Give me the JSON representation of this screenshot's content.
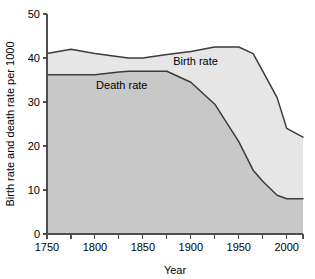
{
  "chart_data": {
    "type": "area",
    "title": "",
    "xlabel": "Year",
    "ylabel": "Birth rate and death rate per 1000",
    "xlim": [
      1750,
      2017
    ],
    "ylim": [
      0,
      50
    ],
    "grid": false,
    "legend_position": "inline-annotation",
    "x_ticks": [
      "1750",
      "1800",
      "1850",
      "1900",
      "1950",
      "2000"
    ],
    "x_tick_values": [
      1750,
      1800,
      1850,
      1900,
      1950,
      2000
    ],
    "x_minor_tick_values": [
      1775,
      1825,
      1875,
      1925,
      1975
    ],
    "y_ticks": [
      "0",
      "10",
      "20",
      "30",
      "40",
      "50"
    ],
    "y_tick_values": [
      0,
      10,
      20,
      30,
      40,
      50
    ],
    "x": [
      1750,
      1775,
      1800,
      1825,
      1835,
      1850,
      1875,
      1900,
      1925,
      1950,
      1965,
      1975,
      1990,
      2000,
      2017
    ],
    "series": [
      {
        "name": "Birth rate",
        "label": "Birth rate",
        "values": [
          41.0,
          42.0,
          41.0,
          40.3,
          40.0,
          40.0,
          40.8,
          41.5,
          42.5,
          42.5,
          41.0,
          37.0,
          31.0,
          24.0,
          22.0
        ],
        "fill_color": "#e6e6e6",
        "line_color": "#3b3b3b",
        "label_x": 1905,
        "label_y": 38.5
      },
      {
        "name": "Death rate",
        "label": "Death rate",
        "values": [
          36.2,
          36.2,
          36.2,
          36.8,
          37.0,
          37.0,
          37.0,
          34.5,
          29.5,
          21.0,
          14.5,
          12.0,
          8.8,
          8.0,
          8.0
        ],
        "fill_color": "#c8c8c8",
        "line_color": "#3b3b3b",
        "label_x": 1828,
        "label_y": 33.0
      }
    ]
  },
  "axes": {
    "x_axis_title": "Year",
    "y_axis_title": "Birth rate and death rate per 1000"
  }
}
